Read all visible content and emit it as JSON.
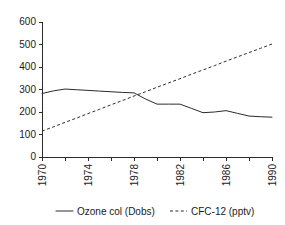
{
  "chart_data": {
    "type": "line",
    "title": "",
    "subtitle": "",
    "xlabel": "",
    "ylabel": "",
    "xlim": [
      1970,
      1990
    ],
    "ylim": [
      0,
      600
    ],
    "grid": false,
    "legend_position": "bottom",
    "x": [
      1970,
      1971,
      1972,
      1973,
      1974,
      1975,
      1976,
      1977,
      1978,
      1979,
      1980,
      1981,
      1982,
      1983,
      1984,
      1985,
      1986,
      1987,
      1988,
      1989,
      1990
    ],
    "xticks": [
      1970,
      1972,
      1974,
      1976,
      1978,
      1980,
      1982,
      1984,
      1986,
      1988,
      1990
    ],
    "xtick_labels": [
      "1970",
      "",
      "1974",
      "",
      "1978",
      "",
      "1982",
      "",
      "1986",
      "",
      "1990"
    ],
    "xtick_labels_major": [
      "1970",
      "1974",
      "1978",
      "1982",
      "1986",
      "1990"
    ],
    "yticks": [
      0,
      100,
      200,
      300,
      400,
      500,
      600
    ],
    "ytick_labels": [
      "0",
      "100",
      "200",
      "300",
      "400",
      "500",
      "600"
    ],
    "series": [
      {
        "name": "Ozone col (Dobs)",
        "style": "solid",
        "color": "#2b2b2b",
        "values": [
          282,
          294,
          302,
          299,
          296,
          293,
          290,
          287,
          285,
          258,
          235,
          235,
          235,
          216,
          197,
          200,
          206,
          194,
          182,
          179,
          177
        ]
      },
      {
        "name": "CFC-12 (pptv)",
        "style": "dashed",
        "color": "#2b2b2b",
        "values": [
          115,
          134,
          154,
          173,
          193,
          212,
          232,
          251,
          271,
          290,
          310,
          329,
          348,
          368,
          387,
          406,
          426,
          445,
          464,
          483,
          502
        ]
      }
    ]
  },
  "legend": {
    "items": [
      {
        "label": "Ozone col (Dobs)",
        "style": "solid"
      },
      {
        "label": "CFC-12 (pptv)",
        "style": "dashed"
      }
    ]
  },
  "colors": {
    "axis": "#2b2b2b",
    "text": "#1a1a1a",
    "background": "#ffffff"
  }
}
